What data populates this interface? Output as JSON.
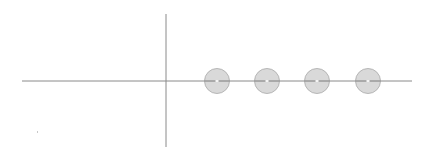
{
  "diagram": {
    "background": "#ffffff",
    "axis_color": "#8a8a8a",
    "circle_fill": "#d9d9d9",
    "circle_stroke": "#a8a8a8",
    "circle_center_mark": "#f4f4f4",
    "horizontal_axis": {
      "x1": 22,
      "y1": 81,
      "x2": 412,
      "y2": 81
    },
    "vertical_axis": {
      "x1": 166,
      "y1": 14,
      "x2": 166,
      "y2": 147
    },
    "circle_radius": 12.5,
    "circles": [
      {
        "cx": 217,
        "cy": 81
      },
      {
        "cx": 267,
        "cy": 81
      },
      {
        "cx": 317,
        "cy": 81
      },
      {
        "cx": 368,
        "cy": 81
      }
    ],
    "speck": {
      "x": 37,
      "y": 131
    }
  }
}
